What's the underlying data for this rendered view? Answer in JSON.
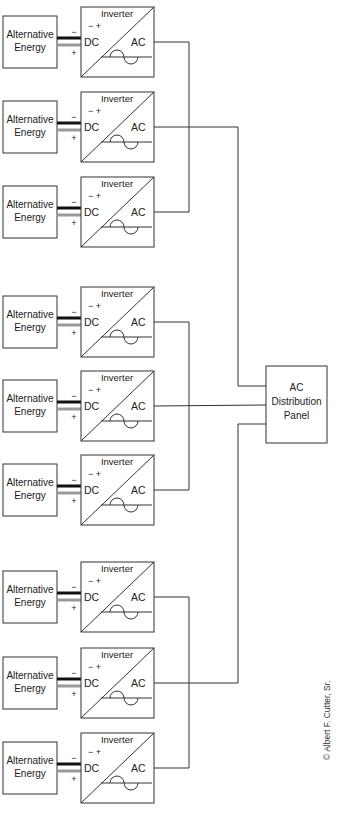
{
  "diagram": {
    "type": "block-diagram",
    "unit_labels": {
      "source": [
        "Alternative",
        "Energy"
      ],
      "inverter_title": "Inverter",
      "dc_label": "DC",
      "ac_label": "AC",
      "polarity_top": "− +",
      "minus": "−",
      "plus": "+"
    },
    "groups": [
      {
        "name": "group-1",
        "units": [
          {
            "y": 7
          },
          {
            "y": 92
          },
          {
            "y": 177
          }
        ]
      },
      {
        "name": "group-2",
        "units": [
          {
            "y": 287
          },
          {
            "y": 371
          },
          {
            "y": 455
          }
        ]
      },
      {
        "name": "group-3",
        "units": [
          {
            "y": 562
          },
          {
            "y": 648
          },
          {
            "y": 733
          }
        ]
      }
    ],
    "panel": {
      "lines": [
        "AC",
        "Distribution",
        "Panel"
      ]
    },
    "credit": "© Albert F. Cutter, Sr.",
    "colors": {
      "line": "#333333",
      "dc_negative": "#111111",
      "dc_positive": "#999999",
      "background": "#ffffff"
    }
  }
}
